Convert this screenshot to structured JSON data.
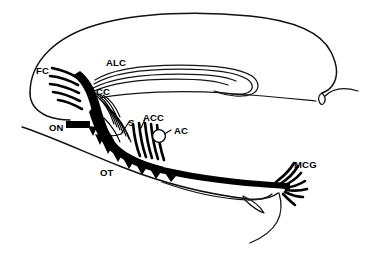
{
  "figure": {
    "background_color": "#ffffff",
    "ink_color": "#000000",
    "width": 372,
    "height": 256
  },
  "labels": [
    {
      "id": "fc",
      "abbrev": "FC",
      "meaning": "frontal cortex",
      "x": 36,
      "y": 66
    },
    {
      "id": "alc",
      "abbrev": "ALC",
      "meaning": "anterior limb of the anterior commissure / lateral olfactory cortex",
      "x": 106,
      "y": 58
    },
    {
      "id": "cc",
      "abbrev": "CC",
      "meaning": "corpus callosum",
      "x": 96,
      "y": 87
    },
    {
      "id": "on",
      "abbrev": "ON",
      "meaning": "olfactory nerve",
      "x": 49,
      "y": 123
    },
    {
      "id": "s",
      "abbrev": "S",
      "meaning": "septum",
      "x": 128,
      "y": 118
    },
    {
      "id": "acc",
      "abbrev": "ACC",
      "meaning": "anterior cingulate cortex",
      "x": 143,
      "y": 113
    },
    {
      "id": "ac",
      "abbrev": "AC",
      "meaning": "anterior commissure",
      "x": 174,
      "y": 126
    },
    {
      "id": "ot",
      "abbrev": "OT",
      "meaning": "olfactory tubercle",
      "x": 100,
      "y": 168
    },
    {
      "id": "mcg",
      "abbrev": "MCG",
      "meaning": "medial cortical group",
      "x": 294,
      "y": 160
    }
  ],
  "structures": {
    "brain_outline": "dorsal cortical contour of the sagittal hemisection",
    "olfactory_tract": "heavy black band running caudally from the olfactory bulb",
    "fiber_bundles": [
      "frontal cortex radiating fibers",
      "anterior limb bundle curving caudally",
      "septal vertical striations",
      "olfactory tubercle serrated fibers",
      "medial cortical group terminal splay"
    ]
  }
}
